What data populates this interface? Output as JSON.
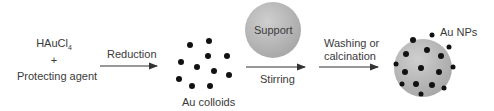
{
  "reactants": {
    "line1": "HAuCl",
    "line1_sub": "4",
    "plus": "+",
    "line3": "Protecting agent"
  },
  "steps": [
    {
      "label": "Reduction",
      "position": "above"
    },
    {
      "label": "Stirring",
      "position": "below"
    },
    {
      "label": "Washing or",
      "label2": "calcination",
      "position": "above"
    }
  ],
  "nodes": {
    "colloids": {
      "label": "Au colloids",
      "dot_count": 11
    },
    "support": {
      "label": "Support"
    },
    "product": {
      "label": "Au NPs"
    }
  },
  "colors": {
    "sphere": "#b8b8b8",
    "dot": "#111111",
    "arrow": "#333333",
    "text": "#3a3a3a"
  }
}
